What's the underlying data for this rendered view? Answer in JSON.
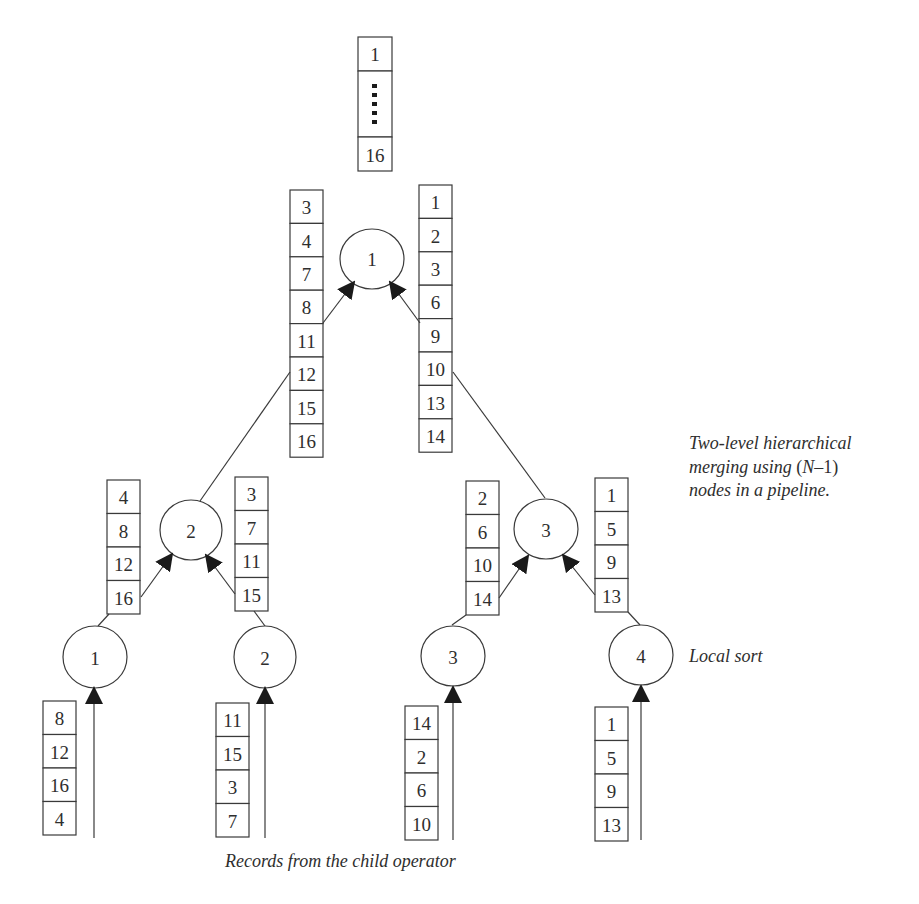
{
  "diagram": {
    "title": "Two-level hierarchical merging using (N–1) nodes in a pipeline.",
    "output": {
      "cells": [
        "1",
        "⋮",
        "16"
      ]
    },
    "level2_node": {
      "label": "1"
    },
    "level2_inputs": {
      "left": [
        "3",
        "4",
        "7",
        "8",
        "11",
        "12",
        "15",
        "16"
      ],
      "right": [
        "1",
        "2",
        "3",
        "6",
        "9",
        "10",
        "13",
        "14"
      ]
    },
    "level1_nodes": [
      {
        "label": "2",
        "left_input": [
          "4",
          "8",
          "12",
          "16"
        ],
        "right_input": [
          "3",
          "7",
          "11",
          "15"
        ]
      },
      {
        "label": "3",
        "left_input": [
          "2",
          "6",
          "10",
          "14"
        ],
        "right_input": [
          "1",
          "5",
          "9",
          "13"
        ]
      }
    ],
    "local_sort_nodes": [
      {
        "label": "1",
        "records": [
          "8",
          "12",
          "16",
          "4"
        ]
      },
      {
        "label": "2",
        "records": [
          "11",
          "15",
          "3",
          "7"
        ]
      },
      {
        "label": "3",
        "records": [
          "14",
          "2",
          "6",
          "10"
        ]
      },
      {
        "label": "4",
        "records": [
          "1",
          "5",
          "9",
          "13"
        ]
      }
    ],
    "labels": {
      "caption_line1": "Two-level hierarchical",
      "caption_line2_pre": "merging using ",
      "caption_line2_paren_open": "(",
      "caption_line2_N": "N",
      "caption_line2_rest": "–1)",
      "caption_line3": "nodes in a pipeline.",
      "local_sort": "Local sort",
      "records_source": "Records from the child operator"
    }
  }
}
